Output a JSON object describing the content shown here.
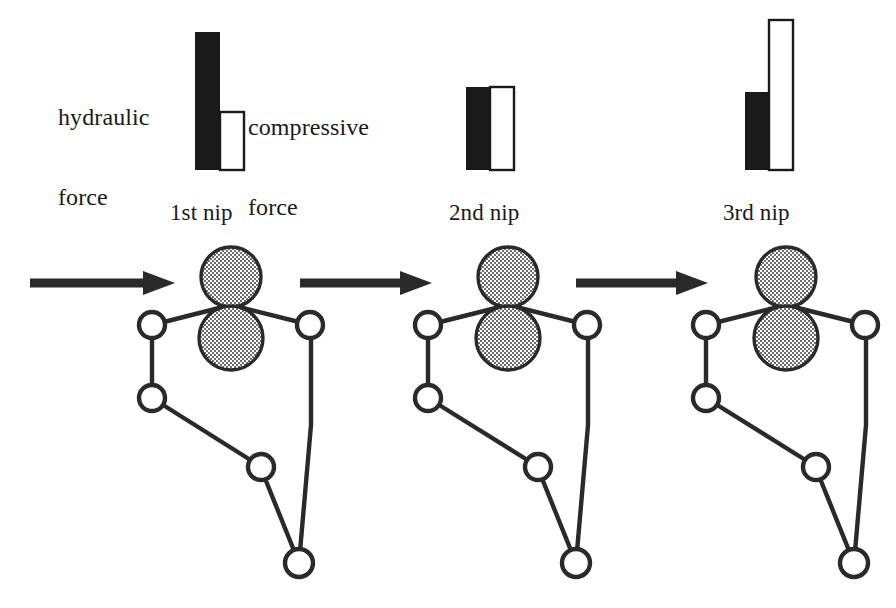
{
  "diagram": {
    "type": "process-diagram",
    "background_color": "#ffffff",
    "ink_color": "#1a1a1a",
    "roller_fill_color": "#b9b9b9",
    "guide_roller_fill_color": "#ffffff"
  },
  "legend": {
    "hydraulic_label": "hydraulic\nforce",
    "hydraulic_line1": "hydraulic",
    "hydraulic_line2": "force",
    "compressive_label": "compressive\nforce",
    "compressive_line1": "compressive",
    "compressive_line2": "force",
    "hydraulic_swatch_color": "#1a1a1a",
    "compressive_swatch_color": "#ffffff"
  },
  "chart_data": {
    "type": "bar",
    "categories": [
      "1st nip",
      "2nd nip",
      "3rd nip"
    ],
    "series": [
      {
        "name": "hydraulic force",
        "color": "#1a1a1a",
        "values": [
          138,
          83,
          78
        ]
      },
      {
        "name": "compressive force",
        "color": "#ffffff",
        "values": [
          58,
          83,
          150
        ]
      }
    ],
    "units": "relative (bar height in px)",
    "xlabel": "",
    "ylabel": "force",
    "ylim": [
      0,
      150
    ],
    "grid": false,
    "legend_position": "top-left",
    "baseline_y": 170
  },
  "nips": [
    {
      "label": "1st nip",
      "label_x": 170,
      "label_y": 200,
      "center_x": 231,
      "bar_black_height": 138,
      "bar_white_height": 58,
      "bar_x": 195
    },
    {
      "label": "2nd nip",
      "label_x": 449,
      "label_y": 200,
      "center_x": 508,
      "bar_black_height": 83,
      "bar_white_height": 83,
      "bar_x": 466
    },
    {
      "label": "3rd nip",
      "label_x": 723,
      "label_y": 200,
      "center_x": 786,
      "bar_black_height": 78,
      "bar_white_height": 150,
      "bar_x": 745
    }
  ],
  "arrows": [
    {
      "name": "inlet-arrow",
      "x1": 30,
      "x2": 160,
      "y": 283,
      "direction": "right"
    },
    {
      "name": "transfer-arrow-1",
      "x1": 300,
      "x2": 430,
      "y": 283,
      "direction": "right"
    },
    {
      "name": "transfer-arrow-2",
      "x1": 576,
      "x2": 706,
      "y": 283,
      "direction": "right"
    }
  ],
  "press_section": {
    "description": "Twin roller nip with felt loop over five guide rollers",
    "top_roller": {
      "name": "top-press-roller",
      "r": 30
    },
    "bottom_roller": {
      "name": "bottom-press-roller",
      "r": 32
    },
    "guide_rollers_count": 5,
    "guide_roller_radius": 13,
    "felt_loop": "closed belt path"
  }
}
